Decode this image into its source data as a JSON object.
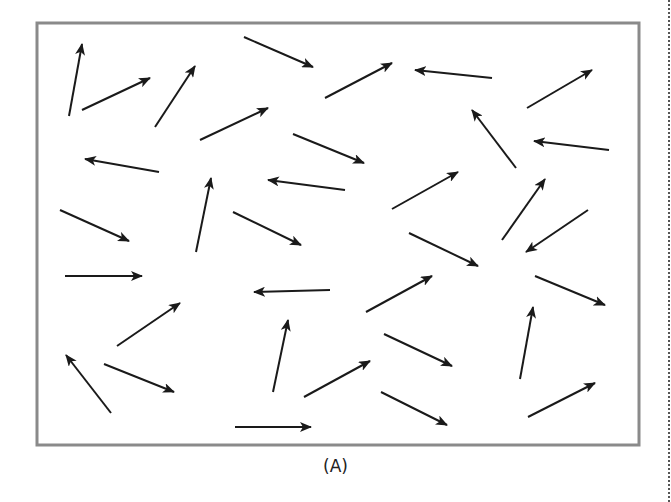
{
  "figure": {
    "caption": "(A)",
    "frame": {
      "x": 37,
      "y": 23,
      "width": 602,
      "height": 422,
      "stroke": "#8a8a8a",
      "stroke_width": 3
    },
    "arrow_color": "#1a1a1a",
    "arrow_count": 34
  },
  "arrows": [
    {
      "x1": 69,
      "y1": 116,
      "x2": 82,
      "y2": 44
    },
    {
      "x1": 82,
      "y1": 110,
      "x2": 150,
      "y2": 78
    },
    {
      "x1": 155,
      "y1": 127,
      "x2": 195,
      "y2": 66
    },
    {
      "x1": 244,
      "y1": 37,
      "x2": 313,
      "y2": 67
    },
    {
      "x1": 200,
      "y1": 140,
      "x2": 268,
      "y2": 108
    },
    {
      "x1": 325,
      "y1": 98,
      "x2": 392,
      "y2": 63
    },
    {
      "x1": 492,
      "y1": 78,
      "x2": 415,
      "y2": 70
    },
    {
      "x1": 527,
      "y1": 108,
      "x2": 592,
      "y2": 70
    },
    {
      "x1": 516,
      "y1": 168,
      "x2": 472,
      "y2": 110
    },
    {
      "x1": 609,
      "y1": 150,
      "x2": 534,
      "y2": 141
    },
    {
      "x1": 293,
      "y1": 134,
      "x2": 364,
      "y2": 163
    },
    {
      "x1": 159,
      "y1": 172,
      "x2": 85,
      "y2": 159
    },
    {
      "x1": 345,
      "y1": 190,
      "x2": 268,
      "y2": 180
    },
    {
      "x1": 196,
      "y1": 252,
      "x2": 211,
      "y2": 178
    },
    {
      "x1": 60,
      "y1": 210,
      "x2": 129,
      "y2": 241
    },
    {
      "x1": 233,
      "y1": 212,
      "x2": 301,
      "y2": 245
    },
    {
      "x1": 392,
      "y1": 209,
      "x2": 458,
      "y2": 172
    },
    {
      "x1": 502,
      "y1": 240,
      "x2": 545,
      "y2": 179
    },
    {
      "x1": 588,
      "y1": 210,
      "x2": 526,
      "y2": 252
    },
    {
      "x1": 409,
      "y1": 233,
      "x2": 478,
      "y2": 266
    },
    {
      "x1": 65,
      "y1": 276,
      "x2": 142,
      "y2": 276
    },
    {
      "x1": 330,
      "y1": 290,
      "x2": 254,
      "y2": 292
    },
    {
      "x1": 366,
      "y1": 312,
      "x2": 432,
      "y2": 276
    },
    {
      "x1": 535,
      "y1": 276,
      "x2": 605,
      "y2": 305
    },
    {
      "x1": 117,
      "y1": 346,
      "x2": 180,
      "y2": 303
    },
    {
      "x1": 273,
      "y1": 392,
      "x2": 288,
      "y2": 320
    },
    {
      "x1": 520,
      "y1": 379,
      "x2": 533,
      "y2": 307
    },
    {
      "x1": 384,
      "y1": 334,
      "x2": 452,
      "y2": 366
    },
    {
      "x1": 111,
      "y1": 413,
      "x2": 66,
      "y2": 355
    },
    {
      "x1": 104,
      "y1": 364,
      "x2": 174,
      "y2": 392
    },
    {
      "x1": 304,
      "y1": 397,
      "x2": 370,
      "y2": 361
    },
    {
      "x1": 381,
      "y1": 392,
      "x2": 447,
      "y2": 425
    },
    {
      "x1": 528,
      "y1": 417,
      "x2": 595,
      "y2": 383
    },
    {
      "x1": 235,
      "y1": 427,
      "x2": 311,
      "y2": 427
    }
  ]
}
